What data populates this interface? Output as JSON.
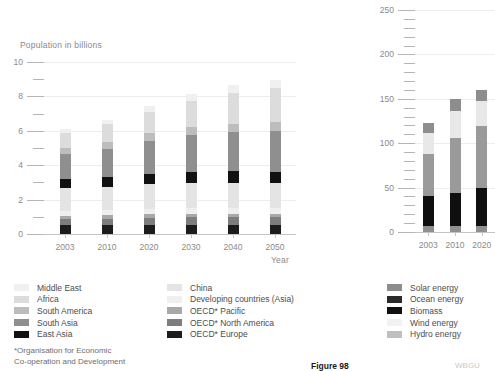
{
  "figure": {
    "label": "Figure 98",
    "credit": "WBGU"
  },
  "footnote": {
    "line1": "*Organisation for Economic",
    "line2": "Co-operation and Development"
  },
  "chart_data": [
    {
      "id": "population",
      "type": "bar",
      "stacked": true,
      "title": "Population in billions",
      "xlabel": "Year",
      "ylabel": "",
      "grid": true,
      "legend_position": "bottom",
      "ylim": [
        0,
        10
      ],
      "yticks": [
        0,
        2,
        4,
        6,
        8,
        10
      ],
      "ytick_labels": [
        "0",
        "2",
        "4",
        "6",
        "8",
        "10"
      ],
      "yminor_step": 1,
      "categories": [
        "2003",
        "2010",
        "2020",
        "2030",
        "2040",
        "2050"
      ],
      "series": [
        {
          "name": "OECD* Europe",
          "color": "#1c1c1c",
          "values": [
            0.53,
            0.54,
            0.55,
            0.55,
            0.54,
            0.53
          ]
        },
        {
          "name": "OECD* North America",
          "color": "#7d7d7d",
          "values": [
            0.33,
            0.36,
            0.4,
            0.43,
            0.46,
            0.48
          ]
        },
        {
          "name": "OECD* Pacific",
          "color": "#a8a8a8",
          "values": [
            0.2,
            0.2,
            0.2,
            0.2,
            0.19,
            0.18
          ]
        },
        {
          "name": "Developing countries (Asia)",
          "color": "#efefef",
          "values": [
            0.28,
            0.3,
            0.32,
            0.34,
            0.35,
            0.35
          ]
        },
        {
          "name": "China",
          "color": "#e4e4e4",
          "values": [
            1.31,
            1.36,
            1.43,
            1.45,
            1.44,
            1.4
          ]
        },
        {
          "name": "East Asia",
          "color": "#111111",
          "values": [
            0.52,
            0.56,
            0.61,
            0.65,
            0.67,
            0.68
          ]
        },
        {
          "name": "South Asia",
          "color": "#8f8f8f",
          "values": [
            1.47,
            1.65,
            1.91,
            2.12,
            2.27,
            2.37
          ]
        },
        {
          "name": "South America",
          "color": "#bdbdbd",
          "values": [
            0.37,
            0.4,
            0.44,
            0.47,
            0.49,
            0.5
          ]
        },
        {
          "name": "Africa",
          "color": "#dcdcdc",
          "values": [
            0.85,
            1.0,
            1.25,
            1.52,
            1.78,
            2.0
          ]
        },
        {
          "name": "Middle East",
          "color": "#f0f0f0",
          "values": [
            0.24,
            0.28,
            0.34,
            0.4,
            0.45,
            0.49
          ]
        }
      ],
      "totals": [
        "6.10",
        "6.65",
        "7.45",
        "8.13",
        "8.64",
        "8.98"
      ]
    },
    {
      "id": "renewable-energy",
      "type": "bar",
      "stacked": true,
      "title": "",
      "xlabel": "",
      "ylabel": "",
      "grid": true,
      "legend_position": "bottom",
      "ylim": [
        0,
        250
      ],
      "yticks": [
        0,
        50,
        100,
        150,
        200,
        250
      ],
      "ytick_labels": [
        "0",
        "50",
        "100",
        "150",
        "200",
        "250"
      ],
      "yminor_step": 10,
      "categories": [
        "2003",
        "2010",
        "2020"
      ],
      "series": [
        {
          "name": "Hydro energy",
          "color": "#8f8f8f",
          "values": [
            7,
            7,
            7
          ]
        },
        {
          "name": "Wind energy",
          "color": "#0f0f0f",
          "values": [
            33,
            37,
            42
          ]
        },
        {
          "name": "Biomass",
          "color": "#9a9a9a",
          "values": [
            48,
            62,
            70
          ]
        },
        {
          "name": "Ocean energy",
          "color": "#e8e8e8",
          "values": [
            23,
            30,
            28
          ]
        },
        {
          "name": "Solar energy",
          "color": "#8d8d8d",
          "values": [
            12,
            14,
            13
          ]
        }
      ],
      "totals": [
        "123",
        "150",
        "160"
      ]
    }
  ],
  "legends": {
    "population_col1": [
      {
        "label": "Middle East",
        "color": "#f0f0f0"
      },
      {
        "label": "Africa",
        "color": "#dcdcdc"
      },
      {
        "label": "South America",
        "color": "#bdbdbd"
      },
      {
        "label": "South Asia",
        "color": "#8f8f8f"
      },
      {
        "label": "East Asia",
        "color": "#111111"
      }
    ],
    "population_col2": [
      {
        "label": "China",
        "color": "#e4e4e4"
      },
      {
        "label": "Developing countries (Asia)",
        "color": "#efefef"
      },
      {
        "label": "OECD* Pacific",
        "color": "#a8a8a8"
      },
      {
        "label": "OECD* North America",
        "color": "#7d7d7d"
      },
      {
        "label": "OECD* Europe",
        "color": "#1c1c1c"
      }
    ],
    "energy": [
      {
        "label": "Solar energy",
        "color": "#8d8d8d"
      },
      {
        "label": "Ocean energy",
        "color": "#2b2b2b"
      },
      {
        "label": "Biomass",
        "color": "#111111"
      },
      {
        "label": "Wind energy",
        "color": "#f2f2f2"
      },
      {
        "label": "Hydro energy",
        "color": "#bfbfbf"
      }
    ]
  }
}
